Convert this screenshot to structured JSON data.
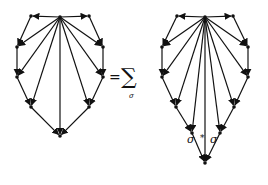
{
  "equation": {
    "equals": "=",
    "sum_symbol": "∑",
    "sum_index": "σ"
  },
  "left_graph": {
    "hub": [
      60,
      17
    ],
    "boundary": [
      [
        31,
        16
      ],
      [
        17,
        47
      ],
      [
        17,
        77
      ],
      [
        31,
        107
      ],
      [
        60,
        136
      ],
      [
        89,
        107
      ],
      [
        103,
        77
      ],
      [
        103,
        47
      ],
      [
        89,
        16
      ]
    ],
    "description": "Wheel-like directed graph: hub with arrows to every boundary vertex; boundary path arrows flowing from top down both sides to bottom vertex"
  },
  "right_graph": {
    "hub": [
      205,
      17
    ],
    "boundary": [
      [
        177,
        16
      ],
      [
        162,
        47
      ],
      [
        162,
        77
      ],
      [
        176,
        107
      ],
      [
        192,
        133
      ],
      [
        205,
        163
      ],
      [
        220,
        133
      ],
      [
        234,
        107
      ],
      [
        248,
        77
      ],
      [
        248,
        47
      ],
      [
        233,
        16
      ]
    ],
    "labels": {
      "left": "σ",
      "star": "*",
      "right": "σ"
    },
    "description": "Same graph with two additional vertices near the bottom labelled σ* and σ"
  },
  "colors": {
    "ink": "#111111",
    "background": "#ffffff"
  }
}
